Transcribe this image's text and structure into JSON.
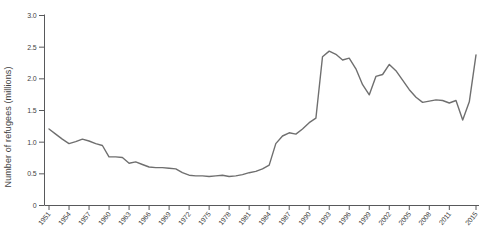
{
  "chart_data": {
    "type": "line",
    "title": "",
    "ylabel": "Number of refugees (millions)",
    "xlabel": "",
    "ylim": [
      0,
      3.0
    ],
    "grid": false,
    "legend": false,
    "yticks": [
      0,
      0.5,
      1.0,
      1.5,
      2.0,
      2.5,
      3.0
    ],
    "ytick_labels": [
      "0",
      "0.5",
      "1.0",
      "1.5",
      "2.0",
      "2.5",
      "3.0"
    ],
    "xtick_years": [
      1951,
      1954,
      1957,
      1960,
      1963,
      1966,
      1969,
      1972,
      1975,
      1978,
      1981,
      1984,
      1987,
      1990,
      1993,
      1996,
      1999,
      2002,
      2005,
      2008,
      2011,
      2015
    ],
    "x": [
      1951,
      1952,
      1953,
      1954,
      1955,
      1956,
      1957,
      1958,
      1959,
      1960,
      1961,
      1962,
      1963,
      1964,
      1965,
      1966,
      1967,
      1968,
      1969,
      1970,
      1971,
      1972,
      1973,
      1974,
      1975,
      1976,
      1977,
      1978,
      1979,
      1980,
      1981,
      1982,
      1983,
      1984,
      1985,
      1986,
      1987,
      1988,
      1989,
      1990,
      1991,
      1992,
      1993,
      1994,
      1995,
      1996,
      1997,
      1998,
      1999,
      2000,
      2001,
      2002,
      2003,
      2004,
      2005,
      2006,
      2007,
      2008,
      2009,
      2010,
      2011,
      2012,
      2013,
      2014,
      2015
    ],
    "series": [
      {
        "name": "Number of refugees (millions)",
        "values": [
          1.2,
          1.12,
          1.04,
          0.97,
          1.0,
          1.04,
          1.01,
          0.97,
          0.94,
          0.76,
          0.76,
          0.75,
          0.66,
          0.68,
          0.64,
          0.6,
          0.59,
          0.59,
          0.58,
          0.57,
          0.51,
          0.47,
          0.46,
          0.46,
          0.45,
          0.46,
          0.47,
          0.45,
          0.46,
          0.48,
          0.51,
          0.53,
          0.57,
          0.63,
          0.97,
          1.09,
          1.14,
          1.12,
          1.2,
          1.3,
          1.37,
          2.34,
          2.43,
          2.38,
          2.29,
          2.32,
          2.15,
          1.9,
          1.74,
          2.03,
          2.06,
          2.22,
          2.12,
          1.97,
          1.82,
          1.7,
          1.62,
          1.64,
          1.66,
          1.65,
          1.61,
          1.65,
          1.34,
          1.63,
          2.37
        ]
      }
    ],
    "line_color": "#6f6f6f",
    "axis_color": "#58595b",
    "text_color": "#3f3f3f",
    "background_color": "#ffffff"
  }
}
